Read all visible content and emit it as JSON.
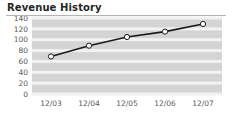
{
  "title": "Revenue History",
  "chart_data": {
    "type": "line",
    "title": "Revenue History",
    "xlabel": "",
    "ylabel": "",
    "categories": [
      "12/03",
      "12/04",
      "12/05",
      "12/06",
      "12/07"
    ],
    "values": [
      69,
      89,
      105,
      115,
      129
    ],
    "series": [
      {
        "name": "Revenue",
        "values": [
          69,
          89,
          105,
          115,
          129
        ]
      }
    ],
    "ylim": [
      0,
      140
    ],
    "yticks": [
      0,
      20,
      40,
      60,
      80,
      100,
      120,
      140
    ],
    "ytick_labels": [
      "0",
      "20",
      "40",
      "60",
      "80",
      "100",
      "120",
      "140"
    ],
    "xtick_labels": [
      "12/03",
      "12/04",
      "12/05",
      "12/06",
      "12/07"
    ],
    "grid": true,
    "grid_orientation": "horizontal",
    "legend": false,
    "legend_position": "none",
    "marker": "open-circle",
    "colors": {
      "plot_background": "#d4d4d4",
      "gridline": "#f2f2f2",
      "line": "#1a1a1a",
      "marker_fill": "#ffffff",
      "marker_stroke": "#1a1a1a",
      "title_text": "#262626",
      "tick_text": "#5a5a5a",
      "rule": "#b3b3b3"
    }
  }
}
